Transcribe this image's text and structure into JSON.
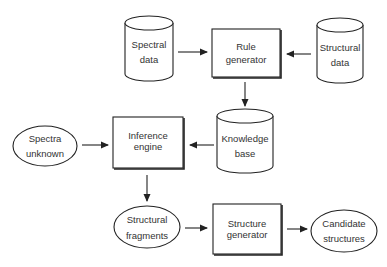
{
  "diagram": {
    "type": "flowchart",
    "nodes": {
      "spectral_data": {
        "label_line1": "Spectral",
        "label_line2": "data",
        "shape": "cylinder"
      },
      "rule_generator": {
        "label_line1": "Rule",
        "label_line2": "generator",
        "shape": "box"
      },
      "structural_data": {
        "label_line1": "Structural",
        "label_line2": "data",
        "shape": "cylinder"
      },
      "knowledge_base": {
        "label_line1": "Knowledge",
        "label_line2": "base",
        "shape": "cylinder"
      },
      "spectra_unknown": {
        "label_line1": "Spectra",
        "label_line2": "unknown",
        "shape": "ellipse"
      },
      "inference_engine": {
        "label_line1": "Inference",
        "label_line2": "engine",
        "shape": "box"
      },
      "structural_fragments": {
        "label_line1": "Structural",
        "label_line2": "fragments",
        "shape": "ellipse"
      },
      "structure_generator": {
        "label_line1": "Structure",
        "label_line2": "generator",
        "shape": "box"
      },
      "candidate_structures": {
        "label_line1": "Candidate",
        "label_line2": "structures",
        "shape": "ellipse"
      }
    },
    "edges": [
      {
        "from": "Spectral data",
        "to": "Rule generator"
      },
      {
        "from": "Structural data",
        "to": "Rule generator"
      },
      {
        "from": "Rule generator",
        "to": "Knowledge base"
      },
      {
        "from": "Knowledge base",
        "to": "Inference engine"
      },
      {
        "from": "Spectra unknown",
        "to": "Inference engine"
      },
      {
        "from": "Inference engine",
        "to": "Structural fragments"
      },
      {
        "from": "Structural fragments",
        "to": "Structure generator"
      },
      {
        "from": "Structure generator",
        "to": "Candidate structures"
      }
    ],
    "colors": {
      "stroke": "#222222",
      "text": "#333333",
      "background": "#ffffff"
    }
  }
}
